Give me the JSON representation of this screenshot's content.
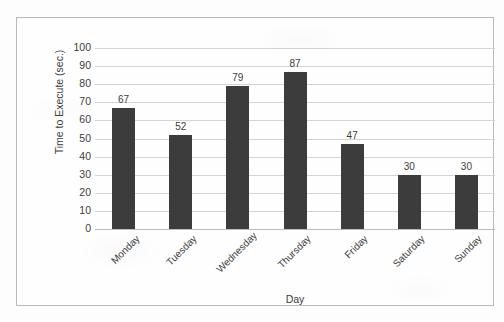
{
  "chart_data": {
    "type": "bar",
    "title": "",
    "xlabel": "Day",
    "ylabel": "Time to Execute (sec.)",
    "categories": [
      "Monday",
      "Tuesday",
      "Wednesday",
      "Thursday",
      "Friday",
      "Saturday",
      "Sunday"
    ],
    "values": [
      67,
      52,
      79,
      87,
      47,
      30,
      30
    ],
    "ylim": [
      0,
      100
    ],
    "yticks": [
      0,
      10,
      20,
      30,
      40,
      50,
      60,
      70,
      80,
      90,
      100
    ],
    "ytick_labels": [
      "0",
      "10",
      "20",
      "30",
      "40",
      "50",
      "60",
      "70",
      "80",
      "90",
      "100"
    ],
    "data_labels": [
      "67",
      "52",
      "79",
      "87",
      "47",
      "30",
      "30"
    ],
    "grid": "horizontal",
    "legend": "none",
    "bar_color": "#3c3c3c",
    "gridline_color": "#d4d4d4",
    "border_color": "#b9b9b9",
    "background_color": "#fefefe",
    "text_color": "#3d3d3d",
    "xtick_rotation": "-45"
  }
}
